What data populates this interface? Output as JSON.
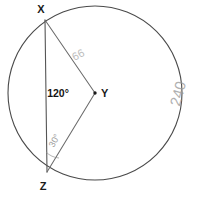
{
  "figure": {
    "background_color": "#ffffff",
    "stroke_color": "#4a4a4a"
  },
  "circle": {
    "center_label": "Y",
    "center_x": 95,
    "center_y": 93,
    "radius": 87
  },
  "points": [
    {
      "label": "X",
      "x": 45,
      "y": 20,
      "label_x": 41,
      "label_y": 13
    },
    {
      "label": "Y",
      "x": 95,
      "y": 93,
      "label_x": 101,
      "label_y": 97
    },
    {
      "label": "Z",
      "x": 47,
      "y": 172,
      "label_x": 43,
      "label_y": 190
    }
  ],
  "segments": [
    {
      "name": "chord-xz",
      "from": "X",
      "to": "Z"
    },
    {
      "name": "radius-xy",
      "from": "X",
      "to": "Y"
    },
    {
      "name": "radius-zy",
      "from": "Z",
      "to": "Y"
    }
  ],
  "angles": [
    {
      "name": "central-angle-xyz",
      "vertex": "Y",
      "value": "120",
      "unit": "°",
      "text": "120°",
      "label_x": 58,
      "label_y": 97
    },
    {
      "name": "inscribed-angle-yzx",
      "vertex": "Z",
      "value": "30",
      "unit": "°",
      "text": "30°",
      "label_x": 57,
      "label_y": 142,
      "rotation": -62
    }
  ],
  "annotations": [
    {
      "name": "handwritten-240",
      "text": "240",
      "x": 183,
      "y": 95,
      "rotation": -75,
      "color": "#9a9a9a"
    },
    {
      "name": "handwritten-scribble",
      "text": "66",
      "x": 80,
      "y": 58,
      "rotation": -28,
      "color": "#a5a5a5"
    }
  ]
}
